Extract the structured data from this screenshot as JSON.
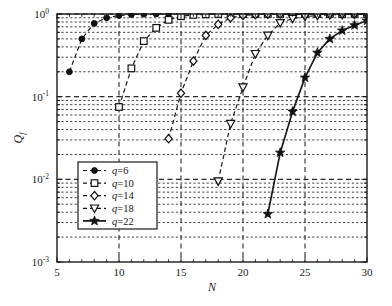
{
  "figure": {
    "name": "probability-vs-N-semilog-plot",
    "background_color": "#ffffff",
    "axes_color": "#1a1a1a",
    "grid_color": "#2b2b2b"
  },
  "axes": {
    "x": {
      "label": "N",
      "ticks": [
        "5",
        "10",
        "15",
        "20",
        "25",
        "30"
      ],
      "tick_values": [
        5,
        10,
        15,
        20,
        25,
        30
      ],
      "range": [
        5,
        30
      ],
      "scale": "linear"
    },
    "y": {
      "label": "Q",
      "label_sub": "f",
      "ticks": [
        {
          "mantissa": "10",
          "exponent": "0"
        },
        {
          "mantissa": "10",
          "exponent": "-1"
        },
        {
          "mantissa": "10",
          "exponent": "-2"
        },
        {
          "mantissa": "10",
          "exponent": "-3"
        }
      ],
      "tick_values": [
        1,
        0.1,
        0.01,
        0.001
      ],
      "range": [
        0.001,
        1
      ],
      "scale": "log"
    },
    "grid": "on (dashed, major and minor)"
  },
  "legend": {
    "position": "lower-left-inside",
    "entries": [
      {
        "label": "q=6",
        "marker": "filled-circle",
        "linestyle": "dashed"
      },
      {
        "label": "q=10",
        "marker": "square",
        "linestyle": "dashed"
      },
      {
        "label": "q=14",
        "marker": "diamond",
        "linestyle": "dashed"
      },
      {
        "label": "q=18",
        "marker": "triangle-down",
        "linestyle": "dashed"
      },
      {
        "label": "q=22",
        "marker": "star",
        "linestyle": "solid"
      }
    ]
  },
  "chart_data": {
    "type": "line",
    "title": "",
    "subtitle": "",
    "xlabel": "N",
    "ylabel": "Qf",
    "xlim": [
      5,
      30
    ],
    "ylim": [
      0.001,
      1
    ],
    "yscale": "log",
    "xscale": "linear",
    "grid": true,
    "legend_position": "lower left",
    "series": [
      {
        "name": "q=6",
        "marker": "filled-circle",
        "linestyle": "dashed",
        "color": "#1a1a1a",
        "x": [
          6,
          7,
          8,
          9,
          10,
          11,
          12,
          13,
          14,
          15,
          16,
          17,
          18,
          19,
          20,
          21,
          22,
          23,
          24,
          25,
          26,
          27,
          28,
          29,
          30
        ],
        "y": [
          0.2,
          0.5,
          0.77,
          0.9,
          0.96,
          0.985,
          0.995,
          1.0,
          1.0,
          1.0,
          1.0,
          1.0,
          1.0,
          1.0,
          1.0,
          1.0,
          1.0,
          1.0,
          1.0,
          1.0,
          1.0,
          1.0,
          1.0,
          1.0,
          1.0
        ]
      },
      {
        "name": "q=10",
        "marker": "square",
        "linestyle": "dashed",
        "color": "#1a1a1a",
        "x": [
          10,
          11,
          12,
          13,
          14,
          15,
          16,
          17,
          18,
          19,
          20,
          21,
          22,
          23,
          24,
          25,
          26,
          27,
          28,
          29,
          30
        ],
        "y": [
          0.075,
          0.22,
          0.47,
          0.68,
          0.85,
          0.94,
          0.975,
          0.99,
          1.0,
          1.0,
          1.0,
          1.0,
          1.0,
          1.0,
          1.0,
          1.0,
          1.0,
          1.0,
          1.0,
          1.0,
          1.0
        ]
      },
      {
        "name": "q=14",
        "marker": "diamond",
        "linestyle": "dashed",
        "color": "#1a1a1a",
        "x": [
          14,
          15,
          16,
          17,
          18,
          19,
          20,
          21,
          22,
          23,
          24,
          25,
          26,
          27,
          28,
          29,
          30
        ],
        "y": [
          0.031,
          0.11,
          0.27,
          0.55,
          0.75,
          0.9,
          0.96,
          0.985,
          0.995,
          1.0,
          1.0,
          1.0,
          1.0,
          1.0,
          1.0,
          1.0,
          1.0
        ]
      },
      {
        "name": "q=18",
        "marker": "triangle-down",
        "linestyle": "dashed",
        "color": "#1a1a1a",
        "x": [
          18,
          19,
          20,
          21,
          22,
          23,
          24,
          25,
          26,
          27,
          28,
          29,
          30
        ],
        "y": [
          0.0095,
          0.047,
          0.13,
          0.33,
          0.55,
          0.78,
          0.88,
          0.93,
          0.96,
          0.975,
          0.985,
          0.99,
          0.995
        ]
      },
      {
        "name": "q=22",
        "marker": "star",
        "linestyle": "solid",
        "color": "#1a1a1a",
        "x": [
          22,
          23,
          24,
          25,
          26,
          27,
          28,
          29,
          30
        ],
        "y": [
          0.0038,
          0.021,
          0.066,
          0.17,
          0.34,
          0.5,
          0.63,
          0.73,
          0.83
        ]
      }
    ]
  }
}
